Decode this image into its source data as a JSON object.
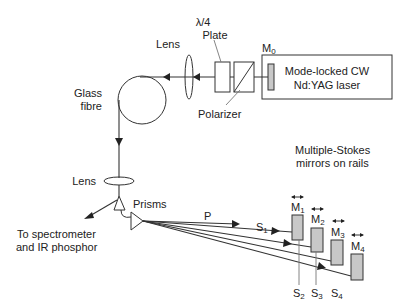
{
  "labels": {
    "lambda_top": "λ/4",
    "plate": "Plate",
    "lens_top": "Lens",
    "m0": "M",
    "m0_sub": "0",
    "laser_line1": "Mode-locked CW",
    "laser_line2": "Nd:YAG laser",
    "polarizer": "Polarizer",
    "glass_line1": "Glass",
    "glass_line2": "fibre",
    "lens_bottom": "Lens",
    "prisms": "Prisms",
    "spectro_line1": "To spectrometer",
    "spectro_line2": "and IR phosphor",
    "stokes_line1": "Multiple-Stokes",
    "stokes_line2": "mirrors on rails",
    "p": "P",
    "s": "S",
    "m": "M",
    "s1_sub": "1",
    "s2_sub": "2",
    "s3_sub": "3",
    "s4_sub": "4",
    "m1_sub": "1",
    "m2_sub": "2",
    "m3_sub": "3",
    "m4_sub": "4"
  },
  "colors": {
    "line": "#333333",
    "mirror_fill": "#c8c8c8",
    "background": "#ffffff"
  }
}
